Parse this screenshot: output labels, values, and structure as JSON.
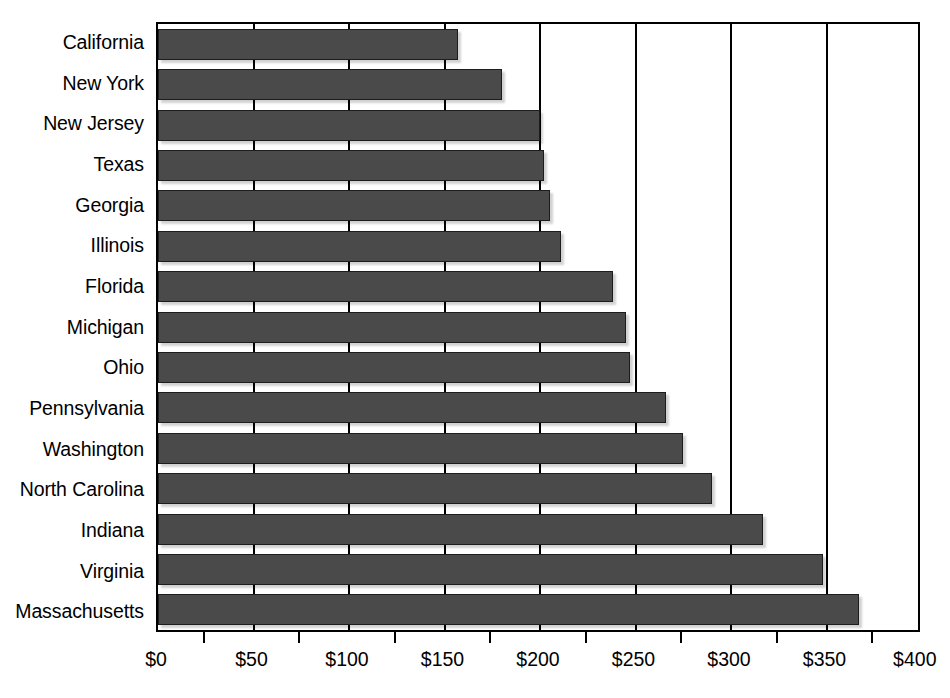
{
  "chart_data": {
    "type": "bar",
    "orientation": "horizontal",
    "title": "",
    "subtitle": "",
    "xlabel": "",
    "ylabel": "",
    "xlim": [
      0,
      400
    ],
    "ylim": null,
    "grid": "vertical",
    "legend": null,
    "bar_color": "#4a4a4a",
    "bar_edge_color": "#1d1d1d",
    "background_color": "#ffffff",
    "axis_color": "#000000",
    "currency_prefix": "$",
    "categories": [
      "California",
      "New York",
      "New Jersey",
      "Texas",
      "Georgia",
      "Illinois",
      "Florida",
      "Michigan",
      "Ohio",
      "Pennsylvania",
      "Washington",
      "North Carolina",
      "Indiana",
      "Virginia",
      "Massachusetts"
    ],
    "values": [
      157,
      180,
      200,
      202,
      205,
      211,
      238,
      245,
      247,
      266,
      275,
      290,
      317,
      348,
      367
    ],
    "xticks": [
      0,
      50,
      100,
      150,
      200,
      250,
      300,
      350,
      400
    ],
    "xtick_labels": [
      "$0",
      "$50",
      "$100",
      "$150",
      "$200",
      "$250",
      "$300",
      "$350",
      "$400"
    ],
    "xminor_ticks": [
      25,
      75,
      125,
      175,
      225,
      275,
      325,
      375
    ],
    "gridline_values": [
      50,
      100,
      150,
      200,
      250,
      300,
      350
    ]
  }
}
